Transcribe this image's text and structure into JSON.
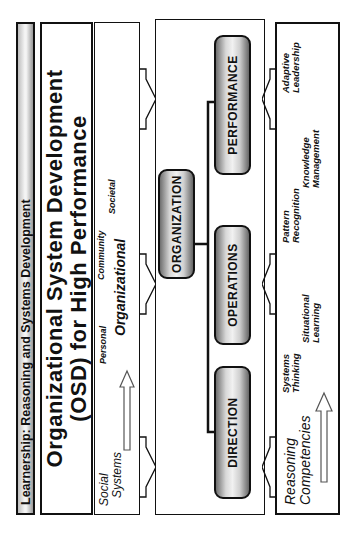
{
  "banner": {
    "title": "Learnership: Reasoning and Systems Development"
  },
  "title": {
    "line1": "Organizational System Development",
    "line2": "(OSD) for High Performance"
  },
  "social_systems": {
    "label_line1": "Social",
    "label_line2": "Systems",
    "levels": [
      "Personal",
      "Organizational",
      "Community",
      "Societal"
    ]
  },
  "osd": {
    "boxes": {
      "organization": "ORGANIZATION",
      "direction": "DIRECTION",
      "operations": "OPERATIONS",
      "performance": "PERFORMANCE"
    }
  },
  "reasoning": {
    "label_line1": "Reasoning",
    "label_line2": "Competencies",
    "competencies": [
      {
        "line1": "Systems",
        "line2": "Thinking"
      },
      {
        "line1": "Situational",
        "line2": "Learning"
      },
      {
        "line1": "Pattern",
        "line2": "Recognition"
      },
      {
        "line1": "Knowledge",
        "line2": "Management"
      },
      {
        "line1": "Adaptive",
        "line2": "Leadership"
      }
    ]
  },
  "colors": {
    "line": "#111111",
    "pill_mid": "#f1f1f1",
    "pill_edge": "#666666",
    "banner_gray": "#bdbdbd"
  }
}
